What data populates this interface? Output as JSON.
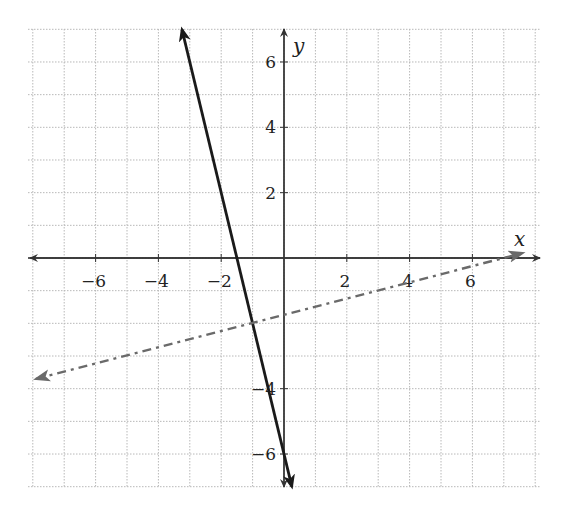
{
  "chart_data": {
    "type": "line",
    "title": "",
    "xlabel": "x",
    "ylabel": "y",
    "xlim": [
      -8.15,
      8.15
    ],
    "ylim": [
      -7,
      7
    ],
    "grid": true,
    "x_ticks": [
      -6,
      -4,
      -2,
      2,
      4,
      6
    ],
    "y_ticks": [
      -6,
      -4,
      2,
      4,
      6
    ],
    "x_tick_labels": [
      "−6",
      "−4",
      "−2",
      "2",
      "4",
      "6"
    ],
    "y_tick_labels": [
      "−6",
      "−4",
      "2",
      "4",
      "6"
    ],
    "series": [
      {
        "name": "solid line",
        "equation": "y = -4x - 6",
        "style": "solid",
        "color": "#1a1a1a",
        "arrows": "both",
        "points": [
          [
            -3.25,
            7
          ],
          [
            0.25,
            -7
          ]
        ]
      },
      {
        "name": "dash-dot line",
        "equation": "y = x/4 - 7/4",
        "style": "dashdot",
        "color": "#6a6a6a",
        "arrows": "both",
        "points": [
          [
            -7.9,
            -3.7
          ],
          [
            7.6,
            0.15
          ]
        ]
      }
    ],
    "intersection": [
      -1,
      -2
    ]
  },
  "colors": {
    "grid": "#b8b8b8",
    "axis": "#333333",
    "solid_line": "#1a1a1a",
    "dashed_line": "#6a6a6a"
  }
}
